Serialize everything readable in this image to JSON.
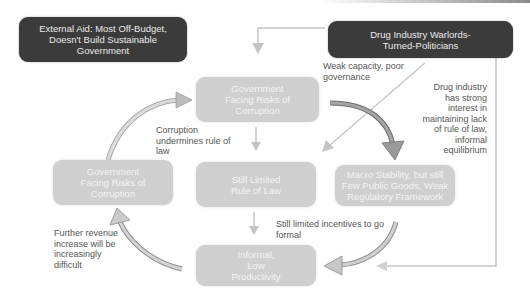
{
  "diagram": {
    "nodes": {
      "external_aid": "External Aid: Most Off-Budget, Doesn't Build Sustainable Government",
      "drug_warlords": "Drug Industry Warlords-Turned-Politicians",
      "gov_corruption_top": "Government Facing Risks of Corruption",
      "gov_corruption_left": "Government Facing Risks of Corruption",
      "limited_rule_of_law": "Still Limited Rule of Law",
      "macro_stability": "Macro Stability, but still Few Public Goods, Weak Regulatory Framework",
      "informal_productivity": "Informal, Low Productivity"
    },
    "labels": {
      "weak_capacity": "Weak capacity, poor governance",
      "corruption_undermines": "Corruption undermines rule of law",
      "drug_interest": "Drug industry has strong interest in maintaining lack of rule of law, informal equilibrium",
      "limited_incentives": "Still limited incentives to go formal",
      "further_revenue": "Further revenue increase will be increasingly difficult"
    },
    "colors": {
      "dark_box": "#3b3b3b",
      "light_box": "#cfcfcf",
      "arrow": "#b5b5b5",
      "text": "#555555"
    }
  }
}
